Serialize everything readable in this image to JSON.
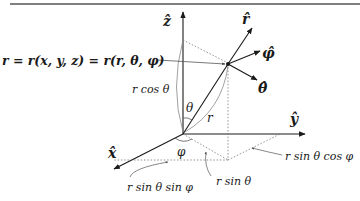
{
  "diagram": {
    "axes": {
      "z": {
        "label": "ẑ"
      },
      "y": {
        "label": "ŷ"
      },
      "x": {
        "label": "x̂"
      }
    },
    "unit_vectors": {
      "r": {
        "label": "r̂"
      },
      "phi": {
        "label": "φ̂"
      },
      "theta": {
        "label": "θ̂"
      }
    },
    "position_equation": "r = r(x, y, z) = r(r, θ, φ)",
    "annotations": {
      "r_cos_theta": "r cos θ",
      "theta": "θ",
      "r": "r",
      "phi": "φ",
      "r_sin_theta": "r sin θ",
      "r_sin_theta_sin_phi": "r sin θ sin φ",
      "r_sin_theta_cos_phi": "r sin θ cos φ"
    },
    "colors": {
      "line": "#1a1a1a",
      "guide": "#777777",
      "border": "#555555"
    }
  }
}
